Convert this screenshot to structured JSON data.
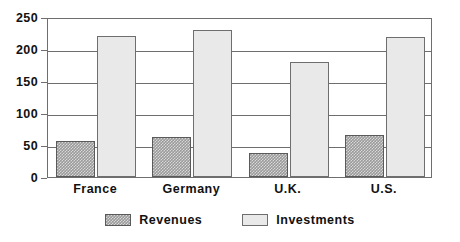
{
  "chart_data": {
    "type": "bar",
    "title": "",
    "subtitle": "",
    "xlabel": "",
    "ylabel": "",
    "categories": [
      "France",
      "Germany",
      "U.K.",
      "U.S."
    ],
    "series": [
      {
        "name": "Revenues",
        "values": [
          57,
          62,
          37,
          65
        ],
        "color": "#9a9a9a",
        "fill": "hatched"
      },
      {
        "name": "Investments",
        "values": [
          221,
          229,
          180,
          218
        ],
        "color": "#e9e9e9",
        "fill": "solid-light"
      }
    ],
    "ylim": [
      0,
      250
    ],
    "yticks": [
      0,
      50,
      100,
      150,
      200,
      250
    ],
    "ytick_labels": [
      "0",
      "50",
      "100",
      "150",
      "200",
      "250"
    ],
    "grid": "horizontal",
    "legend_position": "bottom-center",
    "frame": true
  },
  "legend": {
    "items": [
      {
        "label": "Revenues"
      },
      {
        "label": "Investments"
      }
    ]
  },
  "colors": {
    "axis": "#6e6e6e",
    "text": "#111111",
    "revenues": "#9a9a9a",
    "investments": "#e9e9e9",
    "background": "#ffffff"
  }
}
